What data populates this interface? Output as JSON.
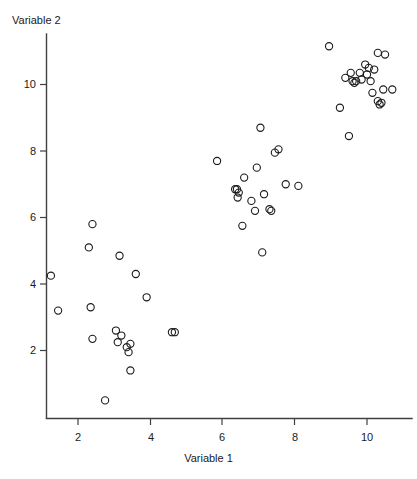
{
  "chart_data": {
    "type": "scatter",
    "title": "",
    "xlabel": "Variable 1",
    "ylabel": "Variable 2",
    "xlim": [
      0.7,
      11.3
    ],
    "ylim": [
      0.1,
      11.6
    ],
    "xticks": [
      2,
      4,
      6,
      8,
      10
    ],
    "yticks": [
      2,
      4,
      6,
      8,
      10
    ],
    "xtick_labels": [
      "2",
      "4",
      "6",
      "8",
      "10"
    ],
    "ytick_labels": [
      "2",
      "4",
      "6",
      "8",
      "10"
    ],
    "grid": false,
    "legend": null,
    "marker": "open-circle",
    "marker_color": "#1a1a1a",
    "n_points": 60,
    "clusters": [
      {
        "name": "lower-left",
        "points": [
          [
            1.25,
            4.25
          ],
          [
            1.45,
            3.2
          ],
          [
            2.4,
            5.8
          ],
          [
            2.3,
            5.1
          ],
          [
            2.35,
            3.3
          ],
          [
            2.4,
            2.35
          ],
          [
            2.75,
            0.5
          ],
          [
            3.15,
            4.85
          ],
          [
            3.05,
            2.6
          ],
          [
            3.1,
            2.25
          ],
          [
            3.35,
            2.1
          ],
          [
            3.4,
            1.95
          ],
          [
            3.45,
            2.2
          ],
          [
            3.45,
            1.4
          ],
          [
            3.6,
            4.3
          ],
          [
            3.9,
            3.6
          ],
          [
            3.2,
            2.45
          ],
          [
            4.6,
            2.55
          ],
          [
            4.68,
            2.55
          ]
        ]
      },
      {
        "name": "middle",
        "points": [
          [
            5.85,
            7.7
          ],
          [
            6.35,
            6.85
          ],
          [
            6.4,
            6.85
          ],
          [
            6.45,
            6.75
          ],
          [
            6.42,
            6.6
          ],
          [
            6.55,
            5.75
          ],
          [
            6.6,
            7.2
          ],
          [
            6.8,
            6.5
          ],
          [
            6.9,
            6.2
          ],
          [
            6.95,
            7.5
          ],
          [
            7.05,
            8.7
          ],
          [
            7.1,
            4.95
          ],
          [
            7.15,
            6.7
          ],
          [
            7.3,
            6.25
          ],
          [
            7.35,
            6.2
          ],
          [
            7.45,
            7.95
          ],
          [
            7.55,
            8.05
          ],
          [
            7.75,
            7.0
          ],
          [
            8.1,
            6.95
          ]
        ]
      },
      {
        "name": "upper-right",
        "points": [
          [
            8.95,
            11.15
          ],
          [
            9.25,
            9.3
          ],
          [
            9.4,
            10.2
          ],
          [
            9.55,
            10.35
          ],
          [
            9.6,
            10.1
          ],
          [
            9.65,
            10.05
          ],
          [
            9.7,
            10.1
          ],
          [
            9.8,
            10.35
          ],
          [
            9.85,
            10.15
          ],
          [
            9.95,
            10.6
          ],
          [
            10.0,
            10.3
          ],
          [
            10.05,
            10.5
          ],
          [
            10.1,
            10.1
          ],
          [
            10.15,
            9.75
          ],
          [
            10.2,
            10.45
          ],
          [
            10.3,
            10.95
          ],
          [
            10.3,
            9.5
          ],
          [
            10.35,
            9.4
          ],
          [
            10.4,
            9.45
          ],
          [
            10.45,
            9.85
          ],
          [
            10.5,
            10.9
          ],
          [
            10.7,
            9.85
          ],
          [
            9.5,
            8.45
          ]
        ]
      }
    ]
  },
  "axes": {
    "ylabel_text": "Variable 2",
    "xlabel_text": "Variable 1"
  }
}
